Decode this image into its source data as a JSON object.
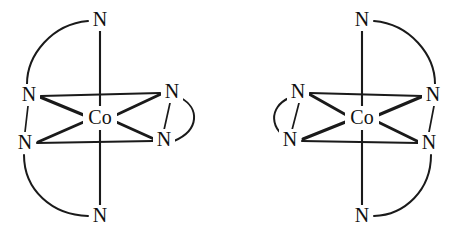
{
  "figure": {
    "caption": "",
    "background_color": "#ffffff",
    "line_color": "#1a1a1a",
    "text_color": "#111111"
  },
  "structures": [
    {
      "id": "left-structure",
      "name": "left-isomer",
      "metal": {
        "label": "Co",
        "x": 100,
        "y": 118
      },
      "ligands": [
        {
          "position": "axial-top",
          "label": "N",
          "x": 100,
          "y": 20
        },
        {
          "position": "axial-bottom",
          "label": "N",
          "x": 100,
          "y": 216
        },
        {
          "position": "upper-left",
          "label": "N",
          "x": 29,
          "y": 95
        },
        {
          "position": "lower-left",
          "label": "N",
          "x": 25,
          "y": 143
        },
        {
          "position": "upper-right",
          "label": "N",
          "x": 172,
          "y": 92
        },
        {
          "position": "lower-right",
          "label": "N",
          "x": 164,
          "y": 140
        }
      ],
      "chelate_arcs": [
        {
          "name": "arc-top-to-upper-left",
          "bulge": "left"
        },
        {
          "name": "arc-lower-left-to-bottom",
          "bulge": "left"
        },
        {
          "name": "arc-upper-right-to-lower-right",
          "bulge": "right"
        }
      ],
      "chelate_straight": [
        {
          "name": "link-upper-left-to-lower-left"
        },
        {
          "name": "link-upper-right-to-lower-right"
        }
      ]
    },
    {
      "id": "right-structure",
      "name": "right-isomer",
      "metal": {
        "label": "Co",
        "x": 362,
        "y": 118
      },
      "ligands": [
        {
          "position": "axial-top",
          "label": "N",
          "x": 362,
          "y": 20
        },
        {
          "position": "axial-bottom",
          "label": "N",
          "x": 362,
          "y": 216
        },
        {
          "position": "upper-left",
          "label": "N",
          "x": 298,
          "y": 92
        },
        {
          "position": "lower-left",
          "label": "N",
          "x": 290,
          "y": 140
        },
        {
          "position": "upper-right",
          "label": "N",
          "x": 433,
          "y": 95
        },
        {
          "position": "lower-right",
          "label": "N",
          "x": 429,
          "y": 143
        }
      ],
      "chelate_arcs": [
        {
          "name": "arc-top-to-upper-right",
          "bulge": "right"
        },
        {
          "name": "arc-lower-right-to-bottom",
          "bulge": "right"
        },
        {
          "name": "arc-upper-left-to-lower-left",
          "bulge": "left"
        }
      ],
      "chelate_straight": [
        {
          "name": "link-upper-right-to-lower-right"
        },
        {
          "name": "link-upper-left-to-lower-left"
        }
      ]
    }
  ]
}
